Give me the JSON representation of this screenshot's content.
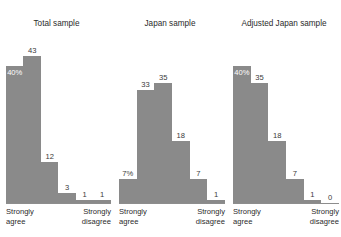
{
  "chart_data": {
    "type": "bar",
    "title": "",
    "xlabel": "",
    "ylabel": "",
    "grid": false,
    "legend": "none",
    "orientation": "vertical",
    "bar_color": "#8a8a8a",
    "axis_color": "#8d8d8d",
    "ylim": [
      0,
      45
    ],
    "categories": [
      "Strongly agree",
      "2",
      "3",
      "4",
      "5",
      "Strongly disagree"
    ],
    "panels": [
      {
        "title": "Total sample",
        "axis_left_label_line1": "Strongly",
        "axis_left_label_line2": "agree",
        "axis_right_label_line1": "Strongly",
        "axis_right_label_line2": "disagree",
        "values": [
          40,
          43,
          12,
          3,
          1,
          1
        ],
        "labels": [
          "40%",
          "43",
          "12",
          "3",
          "1",
          "1"
        ],
        "label_inside": [
          true,
          false,
          false,
          false,
          false,
          false
        ]
      },
      {
        "title": "Japan sample",
        "axis_left_label_line1": "Strongly",
        "axis_left_label_line2": "agree",
        "axis_right_label_line1": "Strongly",
        "axis_right_label_line2": "disagree",
        "values": [
          7,
          33,
          35,
          18,
          7,
          1
        ],
        "labels": [
          "7%",
          "33",
          "35",
          "18",
          "7",
          "1"
        ],
        "label_inside": [
          false,
          false,
          false,
          false,
          false,
          false
        ]
      },
      {
        "title": "Adjusted Japan sample",
        "axis_left_label_line1": "Strongly",
        "axis_left_label_line2": "agree",
        "axis_right_label_line1": "Strongly",
        "axis_right_label_line2": "disagree",
        "values": [
          40,
          35,
          18,
          7,
          1,
          0
        ],
        "labels": [
          "40%",
          "35",
          "18",
          "7",
          "1",
          "0"
        ],
        "label_inside": [
          true,
          false,
          false,
          false,
          false,
          false
        ]
      }
    ]
  }
}
